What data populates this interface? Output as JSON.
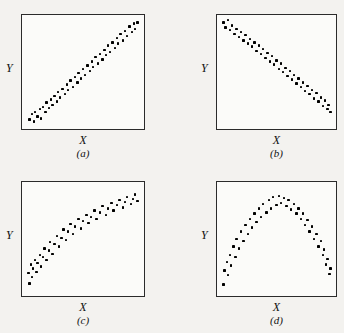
{
  "figure": {
    "background_color": "#f3f2ef",
    "box_border_color": "#2b2b2b",
    "dot_color": "#000000"
  },
  "panels": [
    {
      "key": "a",
      "caption": "(a)",
      "xlabel": "X",
      "ylabel": "Y"
    },
    {
      "key": "b",
      "caption": "(b)",
      "xlabel": "X",
      "ylabel": "Y"
    },
    {
      "key": "c",
      "caption": "(c)",
      "xlabel": "X",
      "ylabel": "Y"
    },
    {
      "key": "d",
      "caption": "(d)",
      "xlabel": "X",
      "ylabel": "Y"
    }
  ],
  "chart_data": [
    {
      "type": "scatter",
      "title": "(a)",
      "xlabel": "X",
      "ylabel": "Y",
      "xlim": [
        0,
        1
      ],
      "ylim": [
        0,
        1
      ],
      "grid": false,
      "legend": null,
      "relationship": "strong positive linear",
      "points": [
        [
          0.03,
          0.05
        ],
        [
          0.05,
          0.1
        ],
        [
          0.07,
          0.03
        ],
        [
          0.08,
          0.12
        ],
        [
          0.1,
          0.08
        ],
        [
          0.12,
          0.15
        ],
        [
          0.13,
          0.06
        ],
        [
          0.15,
          0.17
        ],
        [
          0.17,
          0.12
        ],
        [
          0.18,
          0.21
        ],
        [
          0.2,
          0.16
        ],
        [
          0.22,
          0.24
        ],
        [
          0.23,
          0.19
        ],
        [
          0.25,
          0.27
        ],
        [
          0.27,
          0.22
        ],
        [
          0.28,
          0.31
        ],
        [
          0.3,
          0.26
        ],
        [
          0.32,
          0.34
        ],
        [
          0.34,
          0.29
        ],
        [
          0.36,
          0.38
        ],
        [
          0.37,
          0.33
        ],
        [
          0.39,
          0.42
        ],
        [
          0.41,
          0.36
        ],
        [
          0.43,
          0.45
        ],
        [
          0.45,
          0.4
        ],
        [
          0.46,
          0.49
        ],
        [
          0.48,
          0.44
        ],
        [
          0.5,
          0.53
        ],
        [
          0.52,
          0.47
        ],
        [
          0.54,
          0.56
        ],
        [
          0.56,
          0.51
        ],
        [
          0.58,
          0.6
        ],
        [
          0.59,
          0.55
        ],
        [
          0.61,
          0.64
        ],
        [
          0.63,
          0.58
        ],
        [
          0.65,
          0.67
        ],
        [
          0.67,
          0.62
        ],
        [
          0.69,
          0.71
        ],
        [
          0.7,
          0.66
        ],
        [
          0.72,
          0.75
        ],
        [
          0.74,
          0.69
        ],
        [
          0.76,
          0.78
        ],
        [
          0.78,
          0.73
        ],
        [
          0.8,
          0.82
        ],
        [
          0.81,
          0.77
        ],
        [
          0.83,
          0.86
        ],
        [
          0.85,
          0.8
        ],
        [
          0.87,
          0.89
        ],
        [
          0.89,
          0.84
        ],
        [
          0.91,
          0.93
        ],
        [
          0.93,
          0.88
        ],
        [
          0.95,
          0.96
        ],
        [
          0.96,
          0.91
        ],
        [
          0.98,
          0.97
        ]
      ]
    },
    {
      "type": "scatter",
      "title": "(b)",
      "xlabel": "X",
      "ylabel": "Y",
      "xlim": [
        0,
        1
      ],
      "ylim": [
        0,
        1
      ],
      "grid": false,
      "legend": null,
      "relationship": "strong negative linear",
      "points": [
        [
          0.02,
          0.97
        ],
        [
          0.04,
          0.92
        ],
        [
          0.06,
          0.99
        ],
        [
          0.08,
          0.9
        ],
        [
          0.1,
          0.94
        ],
        [
          0.12,
          0.86
        ],
        [
          0.14,
          0.91
        ],
        [
          0.16,
          0.83
        ],
        [
          0.18,
          0.88
        ],
        [
          0.2,
          0.8
        ],
        [
          0.22,
          0.85
        ],
        [
          0.24,
          0.77
        ],
        [
          0.26,
          0.81
        ],
        [
          0.28,
          0.74
        ],
        [
          0.3,
          0.78
        ],
        [
          0.32,
          0.7
        ],
        [
          0.34,
          0.75
        ],
        [
          0.36,
          0.67
        ],
        [
          0.38,
          0.72
        ],
        [
          0.4,
          0.63
        ],
        [
          0.42,
          0.68
        ],
        [
          0.44,
          0.6
        ],
        [
          0.46,
          0.65
        ],
        [
          0.48,
          0.57
        ],
        [
          0.5,
          0.61
        ],
        [
          0.52,
          0.53
        ],
        [
          0.54,
          0.58
        ],
        [
          0.56,
          0.5
        ],
        [
          0.58,
          0.54
        ],
        [
          0.6,
          0.46
        ],
        [
          0.62,
          0.51
        ],
        [
          0.64,
          0.43
        ],
        [
          0.66,
          0.47
        ],
        [
          0.68,
          0.39
        ],
        [
          0.7,
          0.44
        ],
        [
          0.72,
          0.36
        ],
        [
          0.74,
          0.4
        ],
        [
          0.76,
          0.32
        ],
        [
          0.78,
          0.37
        ],
        [
          0.8,
          0.29
        ],
        [
          0.82,
          0.33
        ],
        [
          0.84,
          0.25
        ],
        [
          0.86,
          0.3
        ],
        [
          0.88,
          0.22
        ],
        [
          0.9,
          0.26
        ],
        [
          0.92,
          0.18
        ],
        [
          0.94,
          0.23
        ],
        [
          0.96,
          0.15
        ],
        [
          0.97,
          0.19
        ],
        [
          0.99,
          0.12
        ]
      ]
    },
    {
      "type": "scatter",
      "title": "(c)",
      "xlabel": "X",
      "ylabel": "Y",
      "xlim": [
        0,
        1
      ],
      "ylim": [
        0,
        1
      ],
      "grid": false,
      "legend": null,
      "relationship": "positive concave (logarithmic) curve",
      "points": [
        [
          0.02,
          0.18
        ],
        [
          0.03,
          0.08
        ],
        [
          0.04,
          0.26
        ],
        [
          0.05,
          0.14
        ],
        [
          0.06,
          0.22
        ],
        [
          0.08,
          0.3
        ],
        [
          0.09,
          0.19
        ],
        [
          0.1,
          0.27
        ],
        [
          0.12,
          0.35
        ],
        [
          0.13,
          0.24
        ],
        [
          0.15,
          0.33
        ],
        [
          0.16,
          0.41
        ],
        [
          0.18,
          0.3
        ],
        [
          0.2,
          0.39
        ],
        [
          0.21,
          0.47
        ],
        [
          0.23,
          0.36
        ],
        [
          0.25,
          0.45
        ],
        [
          0.27,
          0.53
        ],
        [
          0.29,
          0.43
        ],
        [
          0.31,
          0.51
        ],
        [
          0.33,
          0.59
        ],
        [
          0.35,
          0.49
        ],
        [
          0.37,
          0.57
        ],
        [
          0.39,
          0.64
        ],
        [
          0.41,
          0.55
        ],
        [
          0.43,
          0.62
        ],
        [
          0.46,
          0.69
        ],
        [
          0.48,
          0.6
        ],
        [
          0.5,
          0.67
        ],
        [
          0.53,
          0.73
        ],
        [
          0.55,
          0.65
        ],
        [
          0.57,
          0.71
        ],
        [
          0.6,
          0.77
        ],
        [
          0.62,
          0.69
        ],
        [
          0.65,
          0.75
        ],
        [
          0.67,
          0.81
        ],
        [
          0.7,
          0.73
        ],
        [
          0.72,
          0.79
        ],
        [
          0.75,
          0.84
        ],
        [
          0.77,
          0.77
        ],
        [
          0.8,
          0.82
        ],
        [
          0.82,
          0.87
        ],
        [
          0.85,
          0.8
        ],
        [
          0.87,
          0.85
        ],
        [
          0.89,
          0.9
        ],
        [
          0.92,
          0.83
        ],
        [
          0.94,
          0.88
        ],
        [
          0.96,
          0.92
        ],
        [
          0.98,
          0.86
        ]
      ]
    },
    {
      "type": "scatter",
      "title": "(d)",
      "xlabel": "X",
      "ylabel": "Y",
      "xlim": [
        0,
        1
      ],
      "ylim": [
        0,
        1
      ],
      "grid": false,
      "legend": null,
      "relationship": "inverted-U (quadratic) curve",
      "points": [
        [
          0.02,
          0.07
        ],
        [
          0.03,
          0.2
        ],
        [
          0.05,
          0.28
        ],
        [
          0.06,
          0.16
        ],
        [
          0.08,
          0.35
        ],
        [
          0.09,
          0.25
        ],
        [
          0.11,
          0.43
        ],
        [
          0.13,
          0.33
        ],
        [
          0.14,
          0.5
        ],
        [
          0.16,
          0.41
        ],
        [
          0.18,
          0.57
        ],
        [
          0.2,
          0.48
        ],
        [
          0.22,
          0.63
        ],
        [
          0.24,
          0.55
        ],
        [
          0.26,
          0.69
        ],
        [
          0.28,
          0.61
        ],
        [
          0.3,
          0.74
        ],
        [
          0.32,
          0.66
        ],
        [
          0.34,
          0.79
        ],
        [
          0.36,
          0.71
        ],
        [
          0.38,
          0.83
        ],
        [
          0.41,
          0.75
        ],
        [
          0.43,
          0.87
        ],
        [
          0.45,
          0.79
        ],
        [
          0.47,
          0.9
        ],
        [
          0.5,
          0.82
        ],
        [
          0.52,
          0.91
        ],
        [
          0.54,
          0.84
        ],
        [
          0.57,
          0.89
        ],
        [
          0.59,
          0.81
        ],
        [
          0.61,
          0.87
        ],
        [
          0.63,
          0.78
        ],
        [
          0.66,
          0.83
        ],
        [
          0.68,
          0.74
        ],
        [
          0.7,
          0.79
        ],
        [
          0.72,
          0.69
        ],
        [
          0.74,
          0.74
        ],
        [
          0.76,
          0.63
        ],
        [
          0.78,
          0.68
        ],
        [
          0.8,
          0.57
        ],
        [
          0.82,
          0.62
        ],
        [
          0.84,
          0.5
        ],
        [
          0.86,
          0.55
        ],
        [
          0.88,
          0.43
        ],
        [
          0.9,
          0.48
        ],
        [
          0.92,
          0.35
        ],
        [
          0.93,
          0.4
        ],
        [
          0.95,
          0.26
        ],
        [
          0.96,
          0.31
        ],
        [
          0.98,
          0.17
        ],
        [
          0.99,
          0.22
        ]
      ]
    }
  ]
}
